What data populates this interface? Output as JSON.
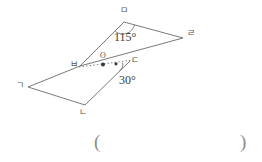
{
  "figure": {
    "stroke_color": "#6b6b6b",
    "dash_color": "#6b6b6b",
    "label_color": "#555555",
    "vertices": [
      {
        "name": "g",
        "label": "ㄱ",
        "x": 28,
        "y": 87,
        "label_x": 16,
        "label_y": 81
      },
      {
        "name": "n",
        "label": "ㄴ",
        "x": 85,
        "y": 105,
        "label_x": 79,
        "label_y": 108
      },
      {
        "name": "d",
        "label": "ㄷ",
        "x": 130,
        "y": 61,
        "label_x": 131,
        "label_y": 56
      },
      {
        "name": "r",
        "label": "ㄹ",
        "x": 183,
        "y": 38,
        "label_x": 187,
        "label_y": 29
      },
      {
        "name": "m",
        "label": "ㅁ",
        "x": 124,
        "y": 22,
        "label_x": 120,
        "label_y": 6
      },
      {
        "name": "b",
        "label": "ㅂ",
        "x": 80,
        "y": 66,
        "label_x": 70,
        "label_y": 60
      }
    ],
    "points": [
      {
        "name": "o",
        "label": "O",
        "x": 103,
        "y": 64,
        "label_x": 100,
        "label_y": 52
      },
      {
        "name": "intersection",
        "label": "",
        "x": 116,
        "y": 64,
        "label_x": 0,
        "label_y": 0
      }
    ],
    "angles": [
      {
        "name": "angle-at-m",
        "value": "115°",
        "label_x": 114,
        "label_y": 31
      },
      {
        "name": "angle-at-intersection",
        "value": "30°",
        "label_x": 119,
        "label_y": 74
      }
    ]
  },
  "answer_area": {
    "open_paren": "(",
    "close_paren": ")"
  }
}
